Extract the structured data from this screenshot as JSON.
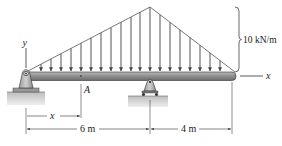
{
  "diagram": {
    "type": "beam-loading",
    "load": {
      "kind": "triangular distributed load",
      "intensity_label": "10 kN/m",
      "peak_at": "right support"
    },
    "axes": {
      "y_label": "y",
      "x_label": "x"
    },
    "points": {
      "section_label": "A"
    },
    "dimensions": {
      "x_label": "x",
      "left_span": "6 m",
      "overhang": "4 m"
    },
    "supports": {
      "left": "pin",
      "right": "roller"
    },
    "colors": {
      "beam": "#8a8a8a",
      "load_arrows": "#555555",
      "ground": "#c8c8c8",
      "lines": "#333333"
    }
  }
}
